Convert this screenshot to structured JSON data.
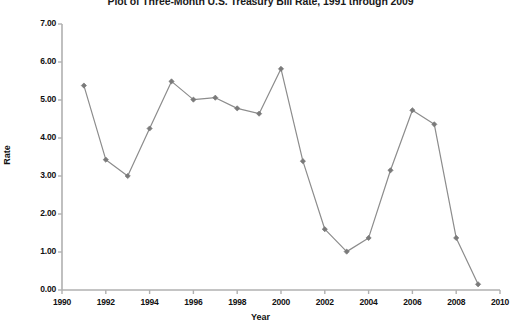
{
  "chart_data": {
    "type": "line",
    "title": "Plot of Three-Month U.S. Treasury Bill Rate, 1991 through 2009",
    "xlabel": "Year",
    "ylabel": "Rate",
    "xlim": [
      1990,
      2010
    ],
    "ylim": [
      0.0,
      7.0
    ],
    "xticks": [
      1990,
      1992,
      1994,
      1996,
      1998,
      2000,
      2002,
      2004,
      2006,
      2008,
      2010
    ],
    "xtick_labels": [
      "1990",
      "1992",
      "1994",
      "1996",
      "1998",
      "2000",
      "2002",
      "2004",
      "2006",
      "2008",
      "2010"
    ],
    "yticks": [
      0.0,
      1.0,
      2.0,
      3.0,
      4.0,
      5.0,
      6.0,
      7.0
    ],
    "ytick_labels": [
      "0.00",
      "1.00",
      "2.00",
      "3.00",
      "4.00",
      "5.00",
      "6.00",
      "7.00"
    ],
    "grid": false,
    "legend": false,
    "marker": "diamond",
    "line_color": "#8c8c8c",
    "marker_color": "#7a7a7a",
    "axis_color": "#b0b0b0",
    "x": [
      1991,
      1992,
      1993,
      1994,
      1995,
      1996,
      1997,
      1998,
      1999,
      2000,
      2001,
      2002,
      2003,
      2004,
      2005,
      2006,
      2007,
      2008,
      2009
    ],
    "values": [
      5.38,
      3.43,
      3.0,
      4.25,
      5.49,
      5.01,
      5.06,
      4.78,
      4.64,
      5.82,
      3.39,
      1.6,
      1.01,
      1.37,
      3.15,
      4.73,
      4.36,
      1.37,
      0.15
    ],
    "series": [
      {
        "name": "Three-Month U.S. Treasury Bill Rate",
        "values": [
          5.38,
          3.43,
          3.0,
          4.25,
          5.49,
          5.01,
          5.06,
          4.78,
          4.64,
          5.82,
          3.39,
          1.6,
          1.01,
          1.37,
          3.15,
          4.73,
          4.36,
          1.37,
          0.15
        ]
      }
    ]
  }
}
